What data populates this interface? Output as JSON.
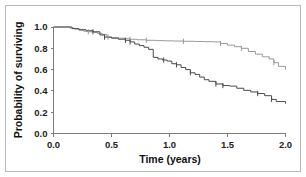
{
  "chart_data": {
    "type": "line",
    "subtype": "kaplan-meier-step",
    "title": "",
    "xlabel": "Time (years)",
    "ylabel": "Probability of surviving",
    "xlim": [
      0.0,
      2.0
    ],
    "ylim": [
      0.0,
      1.0
    ],
    "xticks": [
      "0.0",
      "0.5",
      "1.0",
      "1.5",
      "2.0"
    ],
    "xtick_values": [
      0.0,
      0.5,
      1.0,
      1.5,
      2.0
    ],
    "yticks": [
      "0.0",
      "0.2",
      "0.4",
      "0.6",
      "0.8",
      "1.0"
    ],
    "ytick_values": [
      0.0,
      0.2,
      0.4,
      0.6,
      0.8,
      1.0
    ],
    "grid": false,
    "legend": "none",
    "series": [
      {
        "name": "upper-curve",
        "color": "#9a9a9a",
        "stroke_width": 1,
        "final_value": 0.6,
        "x": [
          0.0,
          0.1,
          0.14,
          0.18,
          0.22,
          0.26,
          0.3,
          0.34,
          0.38,
          0.42,
          0.46,
          0.5,
          0.56,
          0.62,
          0.66,
          0.72,
          0.8,
          0.88,
          0.96,
          1.04,
          1.12,
          1.22,
          1.3,
          1.38,
          1.44,
          1.5,
          1.56,
          1.62,
          1.68,
          1.74,
          1.8,
          1.86,
          1.9,
          1.94,
          2.0
        ],
        "y": [
          1.0,
          1.0,
          0.99,
          0.98,
          0.97,
          0.96,
          0.955,
          0.95,
          0.94,
          0.93,
          0.905,
          0.9,
          0.895,
          0.89,
          0.885,
          0.88,
          0.875,
          0.872,
          0.87,
          0.868,
          0.866,
          0.864,
          0.862,
          0.86,
          0.845,
          0.83,
          0.815,
          0.8,
          0.77,
          0.745,
          0.72,
          0.7,
          0.665,
          0.63,
          0.6
        ],
        "censor_x": [
          0.3,
          0.47,
          0.66,
          0.8,
          1.12,
          1.44,
          1.62,
          1.9
        ],
        "censor_y": [
          0.955,
          0.905,
          0.885,
          0.875,
          0.866,
          0.845,
          0.8,
          0.665
        ]
      },
      {
        "name": "lower-curve",
        "color": "#4a4a4a",
        "stroke_width": 1,
        "final_value": 0.28,
        "x": [
          0.0,
          0.1,
          0.16,
          0.22,
          0.28,
          0.34,
          0.4,
          0.44,
          0.5,
          0.56,
          0.62,
          0.66,
          0.7,
          0.74,
          0.78,
          0.82,
          0.86,
          0.9,
          0.94,
          0.98,
          1.02,
          1.06,
          1.1,
          1.14,
          1.18,
          1.22,
          1.26,
          1.3,
          1.34,
          1.4,
          1.46,
          1.52,
          1.58,
          1.64,
          1.7,
          1.76,
          1.82,
          1.88,
          1.92,
          2.0
        ],
        "y": [
          1.0,
          1.0,
          0.985,
          0.975,
          0.965,
          0.955,
          0.925,
          0.905,
          0.895,
          0.885,
          0.875,
          0.86,
          0.84,
          0.825,
          0.81,
          0.79,
          0.715,
          0.7,
          0.69,
          0.68,
          0.655,
          0.645,
          0.62,
          0.6,
          0.57,
          0.555,
          0.53,
          0.505,
          0.49,
          0.465,
          0.45,
          0.445,
          0.425,
          0.405,
          0.39,
          0.375,
          0.355,
          0.32,
          0.3,
          0.28
        ],
        "censor_x": [
          0.34,
          0.44,
          0.62,
          0.66,
          0.95,
          1.06,
          1.18,
          1.4,
          1.46,
          1.76,
          1.88
        ],
        "censor_y": [
          0.955,
          0.905,
          0.875,
          0.86,
          0.69,
          0.645,
          0.57,
          0.465,
          0.45,
          0.375,
          0.32
        ]
      }
    ]
  },
  "axes": {
    "xlabel": "Time (years)",
    "ylabel": "Probability of surviving"
  }
}
